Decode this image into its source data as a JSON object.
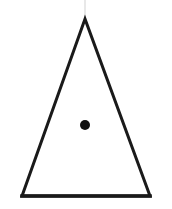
{
  "canvas": {
    "width": 172,
    "height": 209,
    "background_color": "#ffffff"
  },
  "figure": {
    "name": "triangle-with-interior-point",
    "stroke_color": "#1a1a1a",
    "fill_color": "none",
    "stroke_width": 3,
    "base_stroke_width": 3.6,
    "triangle": {
      "apex": {
        "x": 85,
        "y": 19
      },
      "bottom_left": {
        "x": 22,
        "y": 196
      },
      "bottom_right": {
        "x": 150,
        "y": 196
      },
      "points": "85,19 22,196 150,196"
    },
    "point_marker": {
      "name": "interior-dot",
      "center_x": 85,
      "center_y": 125,
      "radius": 5,
      "color": "#111111"
    },
    "artifact": {
      "name": "scan-streak",
      "x": 85,
      "y_start": 0,
      "y_end": 18,
      "color": "#e8e8e8",
      "width": 2
    }
  }
}
